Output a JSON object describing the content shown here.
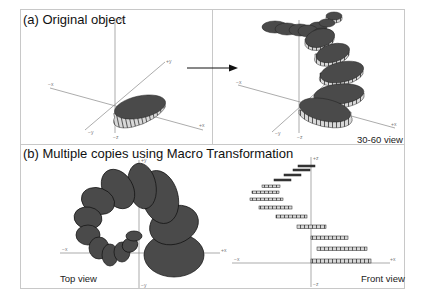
{
  "panel_a": {
    "title": "(a) Original object",
    "axes": {
      "pz": "+z",
      "nz": "−z",
      "px": "+x",
      "nx": "−x",
      "py": "+y",
      "ny": "−y"
    }
  },
  "panel_a_result": {
    "caption": "30-60 view",
    "axes": {
      "nz": "−z",
      "px": "+x",
      "nx": "−x",
      "ny": "−y"
    }
  },
  "panel_b": {
    "title": "(b) Multiple copies using Macro Transformation",
    "top_view": {
      "caption": "Top view",
      "axes": {
        "py": "+y",
        "ny": "−y",
        "px": "+x",
        "nx": "−x"
      }
    },
    "front_view": {
      "caption": "Front view",
      "axes": {
        "pz": "+z",
        "nz": "−z",
        "px": "+x",
        "nx": "−x"
      }
    }
  },
  "colors": {
    "disc_fill": "#4a4a4a",
    "disc_edge": "#9a9a9a",
    "axis": "#888888",
    "frame": "#c8c8c8"
  }
}
